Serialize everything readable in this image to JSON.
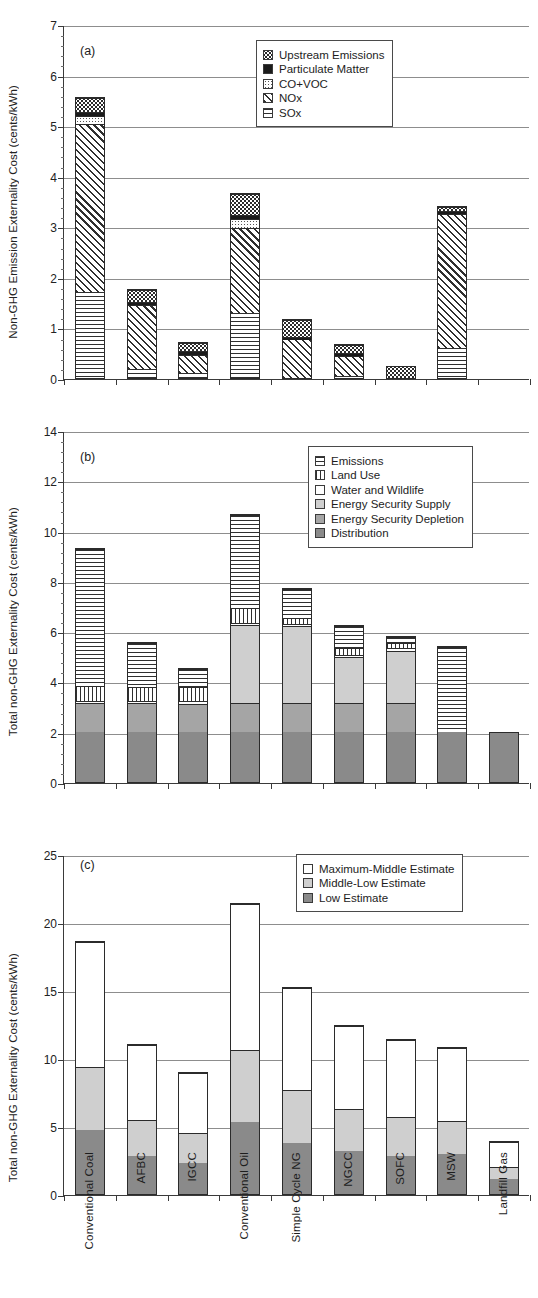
{
  "figure": {
    "categories": [
      "Conventional Coal",
      "AFBC",
      "IGCC",
      "Conventional Oil",
      "Simple Cycle NG",
      "NGCC",
      "SOFC",
      "MSW",
      "Landfill Gas"
    ]
  },
  "panels": [
    {
      "tag": "(a)",
      "ylabel": "Non-GHG Emission Externality Cost (cents/kWh)",
      "yticks": [
        "0",
        "1",
        "2",
        "3",
        "4",
        "5",
        "6",
        "7"
      ],
      "legend": [
        {
          "label": "Upstream Emissions",
          "fill": "f-dots"
        },
        {
          "label": "Particulate Matter",
          "fill": "f-solidblack"
        },
        {
          "label": "CO+VOC",
          "fill": "f-lightdots"
        },
        {
          "label": "NOx",
          "fill": "f-diag"
        },
        {
          "label": "SOx",
          "fill": "f-hlines"
        }
      ]
    },
    {
      "tag": "(b)",
      "ylabel": "Total non-GHG Externality Cost (cents/kWh)",
      "yticks": [
        "0",
        "2",
        "4",
        "6",
        "8",
        "10",
        "12",
        "14"
      ],
      "legend": [
        {
          "label": "Emissions",
          "fill": "f-hlines"
        },
        {
          "label": "Land Use",
          "fill": "f-vlines"
        },
        {
          "label": "Water and Wildlife",
          "fill": "f-white"
        },
        {
          "label": "Energy Security Supply",
          "fill": "f-gray-light"
        },
        {
          "label": "Energy Security Depletion",
          "fill": "f-gray-mid"
        },
        {
          "label": "Distribution",
          "fill": "f-gray-dark"
        }
      ]
    },
    {
      "tag": "(c)",
      "ylabel": "Total non-GHG Externality Cost (cents/kWh)",
      "yticks": [
        "0",
        "5",
        "10",
        "15",
        "20",
        "25"
      ],
      "legend": [
        {
          "label": "Maximum-Middle Estimate",
          "fill": "f-white"
        },
        {
          "label": "Middle-Low Estimate",
          "fill": "f-gray-light"
        },
        {
          "label": "Low Estimate",
          "fill": "f-gray-dark"
        }
      ]
    }
  ],
  "chart_data": [
    {
      "type": "bar",
      "panel": "(a)",
      "stacked": true,
      "title": "(a)",
      "xlabel": "",
      "ylabel": "Non-GHG Emission Externality Cost (cents/kWh)",
      "ylim": [
        0,
        7
      ],
      "ytick_step": 1,
      "grid": true,
      "legend_position": "top-right",
      "categories": [
        "Conventional Coal",
        "AFBC",
        "IGCC",
        "Conventional Oil",
        "Simple Cycle NG",
        "NGCC",
        "SOFC",
        "MSW",
        "Landfill Gas"
      ],
      "series": [
        {
          "name": "SOx",
          "fill": "f-hlines",
          "values": [
            1.72,
            0.18,
            0.1,
            1.3,
            0.0,
            0.05,
            0.0,
            0.6,
            0.0
          ]
        },
        {
          "name": "NOx",
          "fill": "f-diag",
          "values": [
            3.33,
            1.3,
            0.38,
            1.7,
            0.78,
            0.42,
            0.0,
            2.68,
            0.0
          ]
        },
        {
          "name": "CO+VOC",
          "fill": "f-lightdots",
          "values": [
            0.17,
            0.0,
            0.0,
            0.18,
            0.0,
            0.0,
            0.0,
            0.0,
            0.0
          ]
        },
        {
          "name": "Particulate Matter",
          "fill": "f-solidblack",
          "values": [
            0.07,
            0.06,
            0.08,
            0.07,
            0.06,
            0.05,
            0.0,
            0.06,
            0.0
          ]
        },
        {
          "name": "Upstream Emissions",
          "fill": "f-dots",
          "values": [
            0.28,
            0.24,
            0.18,
            0.42,
            0.34,
            0.18,
            0.25,
            0.08,
            0.0
          ]
        }
      ],
      "totals": [
        5.57,
        1.78,
        0.74,
        3.67,
        1.18,
        0.7,
        0.25,
        3.42,
        0.0
      ]
    },
    {
      "type": "bar",
      "panel": "(b)",
      "stacked": true,
      "title": "(b)",
      "xlabel": "",
      "ylabel": "Total non-GHG Externality Cost (cents/kWh)",
      "ylim": [
        0,
        14
      ],
      "ytick_step": 2,
      "grid": true,
      "legend_position": "top-right",
      "categories": [
        "Conventional Coal",
        "AFBC",
        "IGCC",
        "Conventional Oil",
        "Simple Cycle NG",
        "NGCC",
        "SOFC",
        "MSW",
        "Landfill Gas"
      ],
      "series": [
        {
          "name": "Distribution",
          "fill": "f-gray-dark",
          "values": [
            2.02,
            2.02,
            2.02,
            2.02,
            2.02,
            2.02,
            2.02,
            2.02,
            2.02
          ]
        },
        {
          "name": "Energy Security Depletion",
          "fill": "f-gray-mid",
          "values": [
            1.15,
            1.15,
            1.15,
            1.15,
            1.15,
            1.15,
            1.15,
            0.0,
            0.0
          ]
        },
        {
          "name": "Energy Security Supply",
          "fill": "f-gray-light",
          "values": [
            0.0,
            0.0,
            0.0,
            3.12,
            3.1,
            1.85,
            2.12,
            0.0,
            0.0
          ]
        },
        {
          "name": "Water and Wildlife",
          "fill": "f-white",
          "values": [
            0.1,
            0.1,
            0.1,
            0.1,
            0.1,
            0.1,
            0.1,
            0.0,
            0.0
          ]
        },
        {
          "name": "Land Use",
          "fill": "f-vlines",
          "values": [
            0.58,
            0.58,
            0.58,
            0.58,
            0.22,
            0.28,
            0.22,
            0.0,
            0.0
          ]
        },
        {
          "name": "Emissions",
          "fill": "f-hlines",
          "values": [
            5.5,
            1.76,
            0.74,
            3.72,
            1.16,
            0.88,
            0.24,
            3.44,
            0.0
          ]
        }
      ],
      "totals": [
        9.35,
        5.61,
        4.59,
        10.69,
        7.75,
        6.28,
        5.85,
        5.46,
        2.02
      ]
    },
    {
      "type": "bar",
      "panel": "(c)",
      "stacked": true,
      "title": "(c)",
      "xlabel": "",
      "ylabel": "Total non-GHG Externality Cost (cents/kWh)",
      "ylim": [
        0,
        25
      ],
      "ytick_step": 5,
      "grid": true,
      "legend_position": "top-right",
      "categories": [
        "Conventional Coal",
        "AFBC",
        "IGCC",
        "Conventional Oil",
        "Simple Cycle NG",
        "NGCC",
        "SOFC",
        "MSW",
        "Landfill Gas"
      ],
      "series": [
        {
          "name": "Low Estimate",
          "fill": "f-gray-dark",
          "values": [
            4.75,
            2.8,
            2.3,
            5.35,
            3.8,
            3.2,
            2.85,
            3.0,
            1.15
          ]
        },
        {
          "name": "Middle-Low Estimate",
          "fill": "f-gray-light",
          "values": [
            4.7,
            2.75,
            2.25,
            5.35,
            3.95,
            3.1,
            2.9,
            2.45,
            0.9
          ]
        },
        {
          "name": "Maximum-Middle Estimate",
          "fill": "f-white",
          "values": [
            9.25,
            5.55,
            4.5,
            10.75,
            7.55,
            6.2,
            5.7,
            5.4,
            1.95
          ]
        }
      ],
      "totals": [
        18.7,
        11.1,
        9.05,
        21.45,
        15.3,
        12.5,
        11.45,
        10.85,
        4.0
      ]
    }
  ]
}
